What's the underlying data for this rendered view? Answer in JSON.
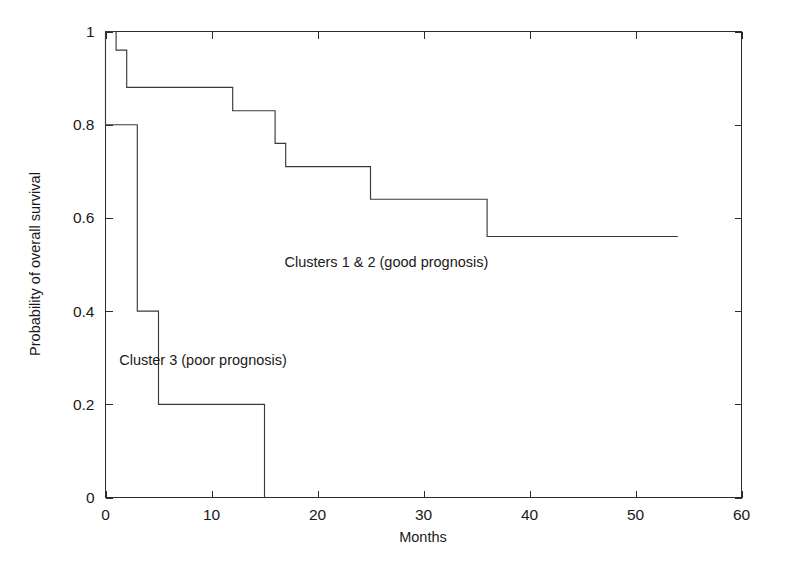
{
  "chart_data": {
    "type": "line",
    "subtype": "kaplan-meier-step",
    "title": "",
    "xlabel": "Months",
    "ylabel": "Probability of overall survival",
    "xlim": [
      0,
      60
    ],
    "ylim": [
      0,
      1
    ],
    "xticks": [
      0,
      10,
      20,
      30,
      40,
      50,
      60
    ],
    "xticklabels": [
      "0",
      "10",
      "20",
      "30",
      "40",
      "50",
      "60"
    ],
    "yticks": [
      0,
      0.2,
      0.4,
      0.6,
      0.8,
      1
    ],
    "yticklabels": [
      "0",
      "0.2",
      "0.4",
      "0.6",
      "0.8",
      "1"
    ],
    "grid": false,
    "legend_position": "inline-annotation",
    "frame": "box",
    "tick_direction": "in",
    "line_color": "#3a3a3a",
    "axis_color": "#2b2b2b",
    "background_color": "#ffffff",
    "series": [
      {
        "name": "Clusters 1 & 2 (good prognosis)",
        "annotation": "Clusters 1 & 2 (good prognosis)",
        "annotation_x": 26.5,
        "annotation_y": 0.495,
        "x": [
          0,
          1,
          1,
          2,
          2,
          12,
          12,
          16,
          16,
          17,
          17,
          25,
          25,
          36,
          36,
          54
        ],
        "y": [
          1.0,
          1.0,
          0.96,
          0.96,
          0.88,
          0.88,
          0.83,
          0.83,
          0.76,
          0.76,
          0.71,
          0.71,
          0.64,
          0.64,
          0.56,
          0.56
        ],
        "steps": [
          {
            "month": 0,
            "probability": 1.0
          },
          {
            "month": 1,
            "probability": 0.96
          },
          {
            "month": 2,
            "probability": 0.88
          },
          {
            "month": 12,
            "probability": 0.83
          },
          {
            "month": 16,
            "probability": 0.76
          },
          {
            "month": 17,
            "probability": 0.71
          },
          {
            "month": 25,
            "probability": 0.64
          },
          {
            "month": 36,
            "probability": 0.56
          },
          {
            "month": 54,
            "probability": 0.56
          }
        ]
      },
      {
        "name": "Cluster 3 (poor prognosis)",
        "annotation": "Cluster 3 (poor prognosis)",
        "annotation_x": 9.2,
        "annotation_y": 0.285,
        "x": [
          0,
          0,
          3,
          3,
          5,
          5,
          15,
          15
        ],
        "y": [
          1.0,
          0.8,
          0.8,
          0.4,
          0.4,
          0.2,
          0.2,
          0.0
        ],
        "steps": [
          {
            "month": 0,
            "probability": 0.8
          },
          {
            "month": 3,
            "probability": 0.4
          },
          {
            "month": 5,
            "probability": 0.2
          },
          {
            "month": 15,
            "probability": 0.0
          }
        ]
      }
    ]
  }
}
